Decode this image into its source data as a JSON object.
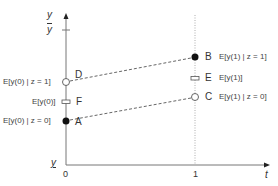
{
  "diagram": {
    "type": "difference-in-differences illustration",
    "axes": {
      "y_label": "y",
      "x_label": "t",
      "y_upper_label": "y",
      "y_upper_mark": "overline",
      "y_lower_label": "y",
      "y_lower_mark": "underline",
      "x_ticks": [
        "0",
        "1"
      ]
    },
    "points": {
      "D": {
        "label": "D",
        "style": "open-circle",
        "t": 0,
        "annotation": "E[y(0) | z = 1]"
      },
      "F": {
        "label": "F",
        "style": "open-rect",
        "t": 0,
        "annotation": "E[y(0)]"
      },
      "A": {
        "label": "A",
        "style": "filled-circle",
        "t": 0,
        "annotation": "E[y(0) | z = 0]"
      },
      "B": {
        "label": "B",
        "style": "filled-circle",
        "t": 1,
        "annotation": "E[y(1) | z = 1]"
      },
      "E": {
        "label": "E",
        "style": "open-rect",
        "t": 1,
        "annotation": "E[y(1)]"
      },
      "C": {
        "label": "C",
        "style": "open-circle",
        "t": 1,
        "annotation": "E[y(1) | z = 0]"
      }
    },
    "lines": [
      {
        "from": "D",
        "to": "B",
        "style": "dashed"
      },
      {
        "from": "A",
        "to": "C",
        "style": "dashed"
      }
    ],
    "colors": {
      "axis": "#666666",
      "dashed": "#555555",
      "dotted": "#999999",
      "filled": "#111111"
    }
  }
}
